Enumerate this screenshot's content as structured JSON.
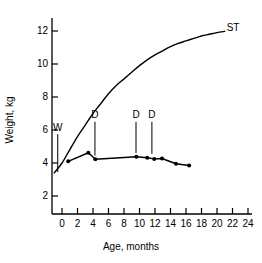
{
  "chart_data": {
    "type": "line",
    "title": "",
    "xlabel": "Age, months",
    "ylabel": "Weight, kg",
    "xlim": [
      -2,
      24
    ],
    "ylim": [
      1.2,
      13.2
    ],
    "xticks": [
      0,
      2,
      4,
      6,
      8,
      10,
      12,
      14,
      16,
      18,
      20,
      22,
      24
    ],
    "xtick_labels": [
      "0",
      "2",
      "4",
      "6",
      "8",
      "10",
      "12",
      "14",
      "16",
      "18",
      "20",
      "22",
      "24"
    ],
    "yticks": [
      2,
      4,
      6,
      8,
      10,
      12
    ],
    "ytick_labels": [
      "2",
      "4",
      "6",
      "8",
      "10",
      "12"
    ],
    "grid": false,
    "legend": "none",
    "series": [
      {
        "name": "ST",
        "label": "ST",
        "style": "smooth-curve",
        "markers": false,
        "label_x": 21.5,
        "label_y": 12.1,
        "x": [
          -1.0,
          0.0,
          1.0,
          2.0,
          3.0,
          4.0,
          5.0,
          6.0,
          7.0,
          8.0,
          9.0,
          10.0,
          11.0,
          12.0,
          13.0,
          14.0,
          15.0,
          16.0,
          17.0,
          18.0,
          19.0,
          20.0,
          21.0
        ],
        "y": [
          3.4,
          4.0,
          4.8,
          5.6,
          6.3,
          7.0,
          7.6,
          8.2,
          8.7,
          9.1,
          9.5,
          9.9,
          10.25,
          10.55,
          10.8,
          11.05,
          11.25,
          11.4,
          11.55,
          11.7,
          11.8,
          11.9,
          11.98
        ]
      },
      {
        "name": "patient",
        "label": "",
        "style": "polyline",
        "markers": true,
        "x": [
          0.8,
          3.4,
          4.3,
          9.6,
          11.0,
          11.9,
          12.9,
          14.7,
          16.4
        ],
        "y": [
          4.1,
          4.62,
          4.23,
          4.38,
          4.32,
          4.25,
          4.27,
          3.95,
          3.85
        ]
      }
    ],
    "annotations": [
      {
        "label": "W",
        "x": -0.55,
        "label_y": 6.05,
        "line_top_y": 5.75,
        "line_bottom_y": 3.45,
        "leader": "vertical"
      },
      {
        "label": "D",
        "x": 4.25,
        "label_y": 6.85,
        "line_top_y": 6.5,
        "line_bottom_y": 4.45,
        "leader": "vertical"
      },
      {
        "label": "D",
        "x": 9.55,
        "label_y": 6.85,
        "line_top_y": 6.5,
        "line_bottom_y": 4.6,
        "leader": "vertical"
      },
      {
        "label": "D",
        "x": 11.6,
        "label_y": 6.85,
        "line_top_y": 6.5,
        "line_bottom_y": 4.55,
        "leader": "vertical"
      }
    ],
    "colors": {
      "axis": "#000000",
      "curve": "#000000",
      "marker": "#000000",
      "background": "#ffffff"
    }
  }
}
